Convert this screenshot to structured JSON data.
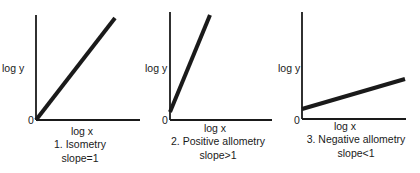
{
  "chart_data": [
    {
      "type": "line",
      "title": "1. Isometry",
      "subtitle": "slope=1",
      "xlabel": "log x",
      "ylabel": "log y",
      "origin_label": "0",
      "grid": false,
      "line": {
        "start": [
          0,
          0
        ],
        "end": [
          1,
          1
        ]
      },
      "slope": "=1",
      "geom": {
        "ax": 36,
        "ay": 120,
        "top": 15,
        "right": 140,
        "x1": 36,
        "y1": 120,
        "x2": 115,
        "y2": 18,
        "ylab_x": 2,
        "ylab_y": 72,
        "o_x": 28,
        "o_y": 124,
        "xlab_x": 82,
        "xlab_y": 135,
        "t1_y": 148,
        "t2_y": 162,
        "cx": 80
      }
    },
    {
      "type": "line",
      "title": "2. Positive allometry",
      "subtitle": "slope>1",
      "xlabel": "log x",
      "ylabel": "log y",
      "origin_label": "0",
      "grid": false,
      "line": {
        "start": [
          0,
          0.08
        ],
        "end": [
          0.38,
          1
        ]
      },
      "slope": ">1",
      "geom": {
        "ax": 170,
        "ay": 120,
        "top": 12,
        "right": 272,
        "x1": 170,
        "y1": 112,
        "x2": 210,
        "y2": 15,
        "ylab_x": 145,
        "ylab_y": 72,
        "o_x": 162,
        "o_y": 124,
        "xlab_x": 215,
        "xlab_y": 132,
        "t1_y": 145,
        "t2_y": 159,
        "cx": 218
      }
    },
    {
      "type": "line",
      "title": "3. Negative allometry",
      "subtitle": "slope<1",
      "xlabel": "log x",
      "ylabel": "log y",
      "origin_label": "0",
      "grid": false,
      "line": {
        "start": [
          0,
          0.1
        ],
        "end": [
          1,
          0.38
        ]
      },
      "slope": "<1",
      "geom": {
        "ax": 302,
        "ay": 119,
        "top": 12,
        "right": 406,
        "x1": 302,
        "y1": 109,
        "x2": 405,
        "y2": 79,
        "ylab_x": 278,
        "ylab_y": 72,
        "o_x": 294,
        "o_y": 124,
        "xlab_x": 345,
        "xlab_y": 130,
        "t1_y": 143,
        "t2_y": 157,
        "cx": 356
      }
    }
  ],
  "colors": {
    "ink": "#1a1a1a",
    "background": "#ffffff"
  }
}
